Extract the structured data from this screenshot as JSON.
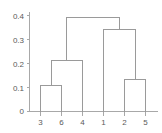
{
  "chart_data": {
    "type": "line",
    "chart_kind": "dendrogram",
    "title": "",
    "subtitle": "",
    "xlabel": "",
    "ylabel": "",
    "grid": false,
    "legend": "none",
    "ylim": [
      0,
      0.42
    ],
    "y_ticks": [
      0,
      0.1,
      0.2,
      0.3,
      0.4
    ],
    "y_tick_labels": [
      "0",
      "0.1",
      "0.2",
      "0.3",
      "0.4"
    ],
    "leaf_order": [
      "3",
      "6",
      "4",
      "1",
      "2",
      "5"
    ],
    "x_tick_labels": [
      "3",
      "6",
      "4",
      "1",
      "2",
      "5"
    ],
    "merges": [
      {
        "id": "m1",
        "left": "3",
        "right": "6",
        "height": 0.11
      },
      {
        "id": "m2",
        "left": "m1",
        "right": "4",
        "height": 0.215
      },
      {
        "id": "m3",
        "left": "2",
        "right": "5",
        "height": 0.135
      },
      {
        "id": "m4",
        "left": "1",
        "right": "m3",
        "height": 0.345
      },
      {
        "id": "m5",
        "left": "m2",
        "right": "m4",
        "height": 0.395
      }
    ],
    "colors": {
      "link": "#9a9a9a",
      "axis": "#a8a8a8",
      "label": "#5a5a5a",
      "background": "#ffffff"
    }
  }
}
